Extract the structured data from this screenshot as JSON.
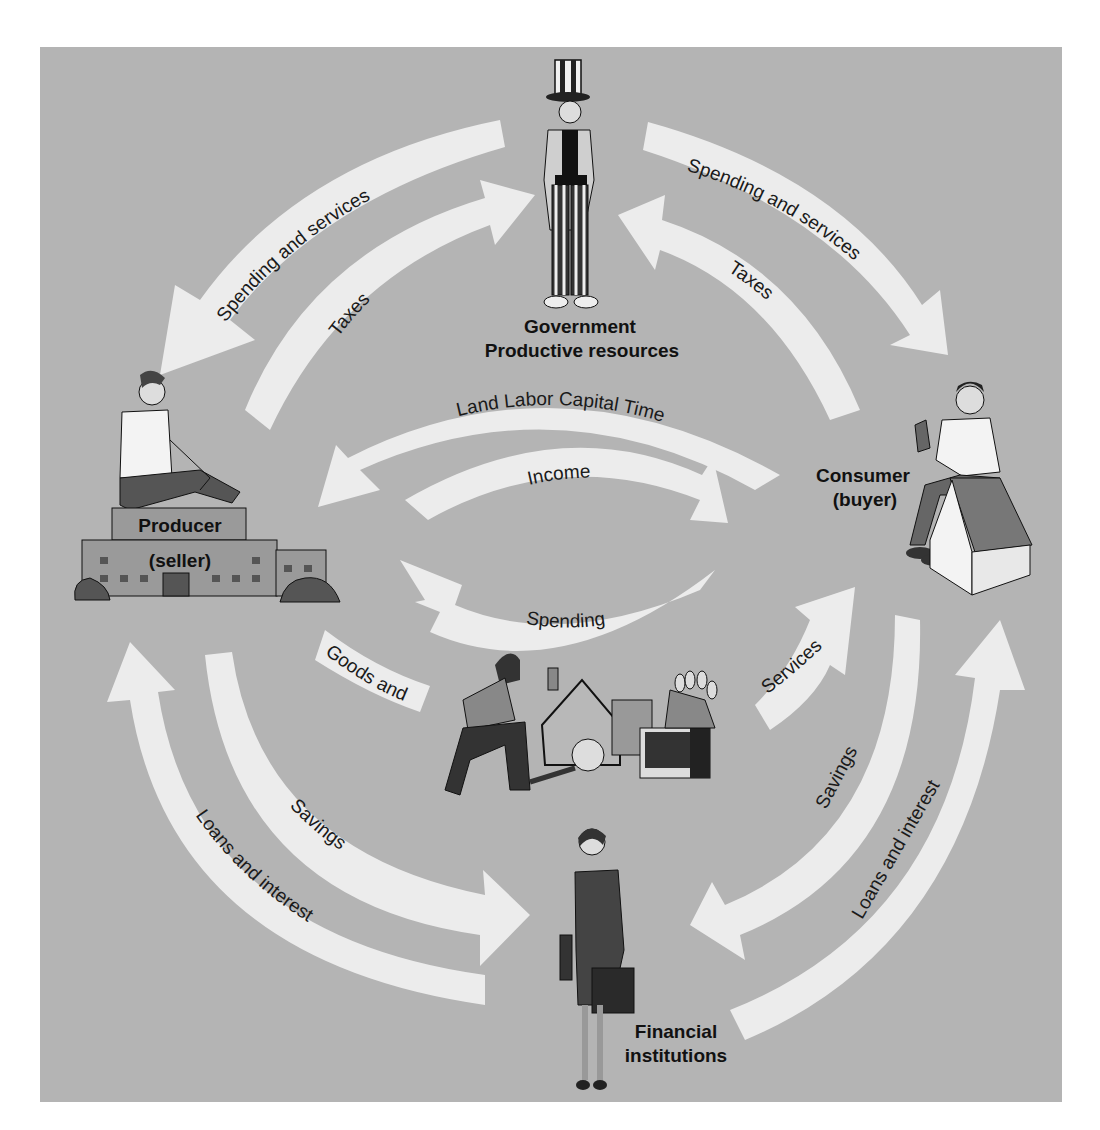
{
  "diagram": {
    "colors": {
      "background": "#b4b4b4",
      "arrow": "#ececec",
      "text": "#111111"
    },
    "nodes": {
      "government": {
        "line1": "Government",
        "line2": "Productive resources"
      },
      "producer": {
        "line1": "Producer",
        "line2": "(seller)"
      },
      "consumer": {
        "line1": "Consumer",
        "line2": "(buyer)"
      },
      "financial": {
        "line1": "Financial",
        "line2": "institutions"
      }
    },
    "flows": {
      "gov_to_producer": "Spending and services",
      "producer_to_gov": "Taxes",
      "gov_to_consumer": "Spending and services",
      "consumer_to_gov": "Taxes",
      "resources": "Land Labor Capital Time",
      "income": "Income",
      "spending": "Spending",
      "goods_and": "Goods and",
      "services": "Services",
      "producer_savings": "Savings",
      "producer_loans": "Loans and interest",
      "consumer_savings": "Savings",
      "consumer_loans": "Loans and interest"
    },
    "icons": {
      "government": "uncle-sam-figure",
      "producer": "man-on-factory",
      "consumer": "man-on-house",
      "goods": "worker-with-goods",
      "financial": "businesswoman"
    }
  }
}
